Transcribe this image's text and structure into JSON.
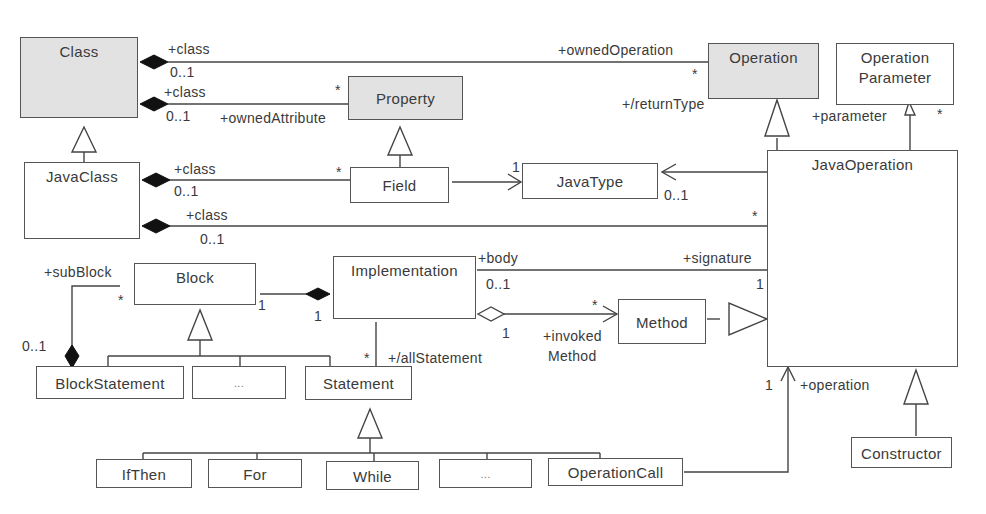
{
  "diagram": {
    "type": "UML class diagram",
    "classes": {
      "class": "Class",
      "property": "Property",
      "operation": "Operation",
      "operation_parameter_line1": "Operation",
      "operation_parameter_line2": "Parameter",
      "java_class": "JavaClass",
      "field": "Field",
      "java_type": "JavaType",
      "java_operation": "JavaOperation",
      "block": "Block",
      "implementation": "Implementation",
      "method": "Method",
      "block_statement": "BlockStatement",
      "ellipsis_1": "...",
      "statement": "Statement",
      "if_then": "IfThen",
      "for": "For",
      "while": "While",
      "ellipsis_2": "...",
      "operation_call": "OperationCall",
      "constructor": "Constructor"
    },
    "labels": {
      "class_ownedop_role": "+class",
      "class_ownedop_mult": "0..1",
      "owned_operation": "+ownedOperation",
      "owned_operation_mult": "*",
      "class_prop_role": "+class",
      "class_prop_mult": "0..1",
      "owned_attribute": "+ownedAttribute",
      "owned_attribute_mult": "*",
      "return_type": "+/returnType",
      "parameter": "+parameter",
      "parameter_mult": "*",
      "jc_field_role": "+class",
      "jc_field_mult": "0..1",
      "field_mult": "*",
      "javatype_mult_1": "1",
      "javatype_mult_01": "0..1",
      "jc_op_role": "+class",
      "jc_op_mult": "0..1",
      "jop_mult": "*",
      "sub_block": "+subBlock",
      "sub_block_mult": "*",
      "block_stmt_mult": "0..1",
      "block_impl_mult": "1",
      "impl_block_mult": "1",
      "body": "+body",
      "body_mult": "0..1",
      "signature": "+signature",
      "signature_mult": "1",
      "invoked_mult_star": "*",
      "invoked_mult_1": "1",
      "invoked_method_1": "+invoked",
      "invoked_method_2": "Method",
      "all_statement": "+/allStatement",
      "all_statement_mult": "*",
      "operation_role": "+operation",
      "operation_mult": "1"
    }
  }
}
